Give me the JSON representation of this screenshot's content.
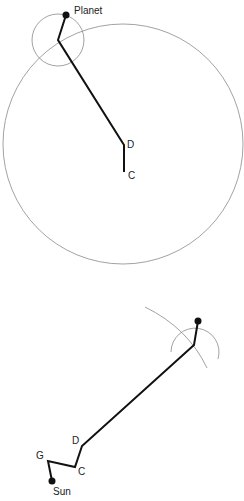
{
  "top_diagram": {
    "labels": {
      "planet": "Planet",
      "d": "D",
      "c": "C"
    },
    "colors": {
      "line": "#111111",
      "circle": "#8a8a8a"
    }
  },
  "bottom_diagram": {
    "labels": {
      "d": "D",
      "c": "C",
      "g": "G",
      "sun": "Sun"
    },
    "colors": {
      "line": "#111111",
      "circle": "#8a8a8a"
    }
  }
}
